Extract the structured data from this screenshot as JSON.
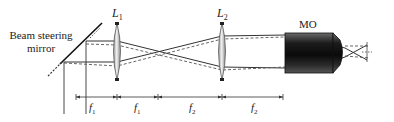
{
  "labels": {
    "mirror": [
      "Beam steering",
      "mirror"
    ],
    "lens1": {
      "main": "L",
      "sub": "1"
    },
    "lens2": {
      "main": "L",
      "sub": "2"
    },
    "objective": "MO"
  },
  "dimensions": [
    {
      "main": "f",
      "sub": "1"
    },
    {
      "main": "f",
      "sub": "1"
    },
    {
      "main": "f",
      "sub": "2"
    },
    {
      "main": "f",
      "sub": "2"
    }
  ],
  "colors": {
    "line": "#333333",
    "dashed": "#555555",
    "lens_fill": "#cfcfcf",
    "objective_dark": "#1a1a1a"
  }
}
